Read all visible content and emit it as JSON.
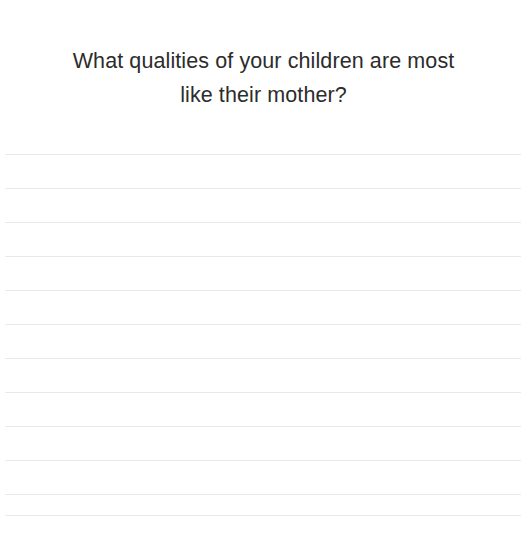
{
  "page": {
    "background_color": "#ffffff",
    "width": 527,
    "height": 544
  },
  "heading": {
    "text": "What qualities of your children are most\nlike their mother?",
    "line_1": "What qualities of your children are most",
    "line_2": "like their mother?",
    "color": "#2c2c2c",
    "align": "center"
  },
  "writing_area": {
    "label": "lined-writing-area",
    "line_color": "#e9e9e9",
    "line_count": 11,
    "line_spacing_px": 34,
    "lines": [
      {
        "index": 1,
        "y": 154
      },
      {
        "index": 2,
        "y": 188
      },
      {
        "index": 3,
        "y": 222
      },
      {
        "index": 4,
        "y": 256
      },
      {
        "index": 5,
        "y": 290
      },
      {
        "index": 6,
        "y": 324
      },
      {
        "index": 7,
        "y": 358
      },
      {
        "index": 8,
        "y": 392
      },
      {
        "index": 9,
        "y": 426
      },
      {
        "index": 10,
        "y": 460
      },
      {
        "index": 11,
        "y": 494
      },
      {
        "index": 12,
        "y": 515
      }
    ]
  }
}
